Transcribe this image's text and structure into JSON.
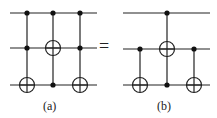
{
  "diagram": {
    "type": "quantum-circuit-identity",
    "equals_sign": "=",
    "panels": [
      {
        "label": "(a)",
        "wires": 3,
        "gates": [
          {
            "type": "toffoli",
            "controls": [
              0,
              1
            ],
            "target": 2
          },
          {
            "type": "cnot",
            "controls": [
              0,
              2
            ],
            "target": 1
          },
          {
            "type": "toffoli",
            "controls": [
              0,
              1
            ],
            "target": 2
          }
        ]
      },
      {
        "label": "(b)",
        "wires": 3,
        "gates": [
          {
            "type": "cnot",
            "controls": [
              1
            ],
            "target": 2
          },
          {
            "type": "toffoli",
            "controls": [
              0,
              2
            ],
            "target": 1
          },
          {
            "type": "cnot",
            "controls": [
              1
            ],
            "target": 2
          }
        ]
      }
    ]
  }
}
